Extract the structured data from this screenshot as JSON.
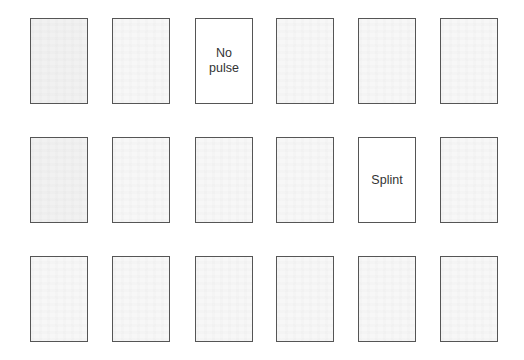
{
  "board": {
    "rows": 3,
    "columns": 6,
    "cards": [
      {
        "row": 0,
        "col": 0,
        "face_up": false,
        "label": "",
        "shade": true
      },
      {
        "row": 0,
        "col": 1,
        "face_up": false,
        "label": ""
      },
      {
        "row": 0,
        "col": 2,
        "face_up": true,
        "label": "No\npulse"
      },
      {
        "row": 0,
        "col": 3,
        "face_up": false,
        "label": ""
      },
      {
        "row": 0,
        "col": 4,
        "face_up": false,
        "label": ""
      },
      {
        "row": 0,
        "col": 5,
        "face_up": false,
        "label": ""
      },
      {
        "row": 1,
        "col": 0,
        "face_up": false,
        "label": "",
        "shade": true
      },
      {
        "row": 1,
        "col": 1,
        "face_up": false,
        "label": ""
      },
      {
        "row": 1,
        "col": 2,
        "face_up": false,
        "label": ""
      },
      {
        "row": 1,
        "col": 3,
        "face_up": false,
        "label": ""
      },
      {
        "row": 1,
        "col": 4,
        "face_up": true,
        "label": "Splint"
      },
      {
        "row": 1,
        "col": 5,
        "face_up": false,
        "label": ""
      },
      {
        "row": 2,
        "col": 0,
        "face_up": false,
        "label": ""
      },
      {
        "row": 2,
        "col": 1,
        "face_up": false,
        "label": ""
      },
      {
        "row": 2,
        "col": 2,
        "face_up": false,
        "label": ""
      },
      {
        "row": 2,
        "col": 3,
        "face_up": false,
        "label": ""
      },
      {
        "row": 2,
        "col": 4,
        "face_up": false,
        "label": ""
      },
      {
        "row": 2,
        "col": 5,
        "face_up": false,
        "label": ""
      }
    ]
  }
}
